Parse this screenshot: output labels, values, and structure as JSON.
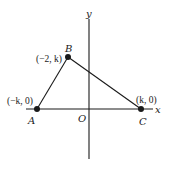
{
  "diagram": {
    "type": "coordinate-plane-triangle",
    "axes": {
      "x_label": "x",
      "y_label": "y",
      "origin_label": "O"
    },
    "points": [
      {
        "name": "A",
        "coord_label": "(−k, 0)"
      },
      {
        "name": "B",
        "coord_label": "(−2, k)"
      },
      {
        "name": "C",
        "coord_label": "(k, 0)"
      }
    ],
    "edges": [
      [
        "A",
        "B"
      ],
      [
        "B",
        "C"
      ],
      [
        "C",
        "A"
      ]
    ],
    "colors": {
      "stroke": "#1a1a1a",
      "background": "#ffffff"
    }
  }
}
